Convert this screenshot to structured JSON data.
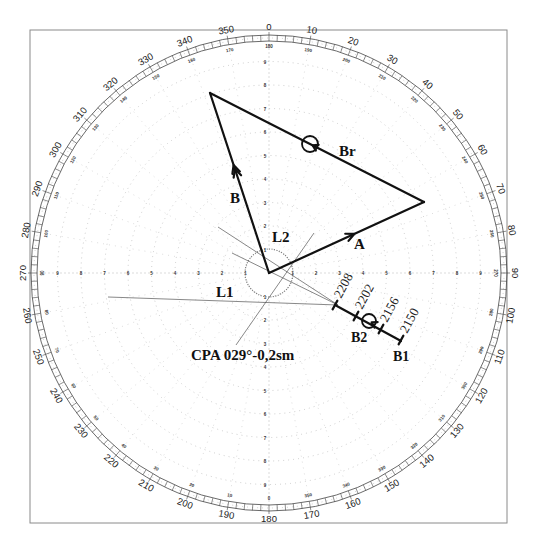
{
  "diagram": {
    "type": "radar-plotting-sheet",
    "frame": {
      "x": 30,
      "y": 30,
      "width": 477,
      "height": 493
    },
    "center": {
      "x": 269,
      "y": 273
    },
    "outer_radius": 238,
    "range_ring_step_px": 23.5,
    "range_rings": 10,
    "bearing_labels": [
      "0",
      "10",
      "20",
      "30",
      "40",
      "50",
      "60",
      "70",
      "80",
      "90",
      "100",
      "110",
      "120",
      "130",
      "140",
      "150",
      "160",
      "170",
      "180",
      "190",
      "200",
      "210",
      "220",
      "230",
      "240",
      "250",
      "260",
      "270",
      "280",
      "290",
      "300",
      "310",
      "320",
      "330",
      "340",
      "350"
    ],
    "reciprocal_labels": [
      "180",
      "190",
      "200",
      "210",
      "220",
      "230",
      "240",
      "250",
      "260",
      "270",
      "280",
      "290",
      "300",
      "310",
      "320",
      "330",
      "340",
      "350",
      "0",
      "10",
      "20",
      "30",
      "40",
      "50",
      "60",
      "70",
      "80",
      "90",
      "100",
      "110",
      "120",
      "130",
      "140",
      "150",
      "160",
      "170"
    ],
    "range_axis_labels": [
      "1",
      "2",
      "3",
      "4",
      "5",
      "6",
      "7",
      "8",
      "9"
    ],
    "colors": {
      "vector": "#111111",
      "construction": "#555555",
      "frame": "#8a8a8a",
      "grid": "#b8b8b8"
    }
  },
  "vectors": {
    "own_ship": {
      "label": "A",
      "from": [
        269,
        273
      ],
      "to": [
        424,
        202
      ]
    },
    "target_true": {
      "label": "B",
      "from": [
        269,
        273
      ],
      "to": [
        210,
        93
      ]
    },
    "relative": {
      "label": "Br",
      "from": [
        424,
        202
      ],
      "to": [
        210,
        93
      ],
      "marker": [
        310,
        144
      ]
    }
  },
  "construction_lines": {
    "L1": {
      "label": "L1",
      "from": [
        108,
        297
      ],
      "to": [
        338,
        305
      ]
    },
    "L2": {
      "label": "L2",
      "from": [
        218,
        227
      ],
      "to": [
        338,
        305
      ]
    },
    "CPA_line": {
      "from": [
        314,
        233
      ],
      "to": [
        236,
        345
      ]
    },
    "extra_line": {
      "from": [
        232,
        253
      ],
      "to": [
        338,
        305
      ]
    }
  },
  "cpa_circle": {
    "cx": 269,
    "cy": 273,
    "r": 24
  },
  "track": {
    "from": [
      335,
      305
    ],
    "to": [
      401,
      341
    ],
    "ticks": [
      {
        "time": "2208",
        "pos": [
          335,
          305
        ]
      },
      {
        "time": "2202",
        "pos": [
          356,
          316
        ]
      },
      {
        "time": "2156",
        "pos": [
          381,
          329
        ]
      },
      {
        "time": "2150",
        "pos": [
          401,
          340
        ]
      }
    ],
    "B2_marker": [
      369,
      321
    ]
  },
  "labels": {
    "A": "A",
    "B": "B",
    "Br": "Br",
    "L1": "L1",
    "L2": "L2",
    "B1": "B1",
    "B2": "B2",
    "cpa": "CPA 029°-0,2sm"
  }
}
